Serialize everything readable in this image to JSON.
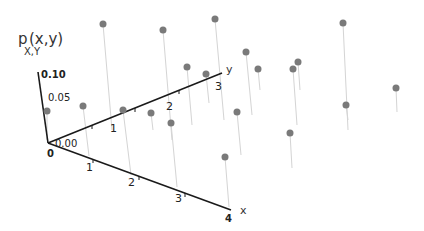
{
  "chart_data": {
    "type": "scatter",
    "subtype": "3d-stem",
    "title": "",
    "zlabel": "p",
    "zlabel_sub": "X,Y",
    "zlabel_suffix": "(x,y)",
    "xlabel": "x",
    "ylabel": "y",
    "x_ticks": [
      "0",
      "1",
      "2",
      "3",
      "4"
    ],
    "y_ticks": [
      "1",
      "2",
      "3"
    ],
    "z_ticks": [
      "0.00",
      "0.05",
      "0.10"
    ],
    "zlim": [
      0,
      0.1
    ],
    "grid": false,
    "legend": "none",
    "points_screen": [
      {
        "dot": [
          103,
          24
        ],
        "base": [
          112,
          130
        ]
      },
      {
        "dot": [
          163,
          30
        ],
        "base": [
          172,
          140
        ]
      },
      {
        "dot": [
          215,
          19
        ],
        "base": [
          224,
          120
        ]
      },
      {
        "dot": [
          343,
          23
        ],
        "base": [
          348,
          130
        ]
      },
      {
        "dot": [
          246,
          52
        ],
        "base": [
          252,
          115
        ]
      },
      {
        "dot": [
          187,
          67
        ],
        "base": [
          192,
          125
        ]
      },
      {
        "dot": [
          206,
          74
        ],
        "base": [
          209,
          103
        ]
      },
      {
        "dot": [
          258,
          69
        ],
        "base": [
          260,
          90
        ]
      },
      {
        "dot": [
          298,
          62
        ],
        "base": [
          300,
          90
        ]
      },
      {
        "dot": [
          293,
          69
        ],
        "base": [
          297,
          125
        ]
      },
      {
        "dot": [
          83,
          106
        ],
        "base": [
          89,
          156
        ]
      },
      {
        "dot": [
          47,
          111
        ],
        "base": [
          47,
          140
        ]
      },
      {
        "dot": [
          123,
          110
        ],
        "base": [
          131,
          175
        ]
      },
      {
        "dot": [
          151,
          113
        ],
        "base": [
          153,
          130
        ]
      },
      {
        "dot": [
          171,
          123
        ],
        "base": [
          177,
          187
        ]
      },
      {
        "dot": [
          237,
          112
        ],
        "base": [
          241,
          155
        ]
      },
      {
        "dot": [
          346,
          105
        ],
        "base": [
          348,
          120
        ]
      },
      {
        "dot": [
          396,
          88
        ],
        "base": [
          397,
          112
        ]
      },
      {
        "dot": [
          290,
          133
        ],
        "base": [
          292,
          168
        ]
      },
      {
        "dot": [
          225,
          157
        ],
        "base": [
          229,
          207
        ]
      }
    ]
  },
  "axes": {
    "origin": [
      48,
      143
    ],
    "x_end": [
      231,
      210
    ],
    "y_end": [
      222,
      73
    ],
    "z_end": [
      38,
      72
    ]
  }
}
